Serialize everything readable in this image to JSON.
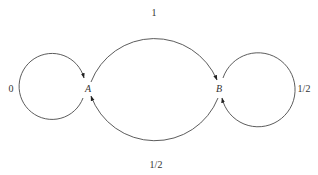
{
  "diagram": {
    "type": "state-transition-graph",
    "nodes": [
      {
        "id": "A",
        "label": "A"
      },
      {
        "id": "B",
        "label": "B"
      }
    ],
    "edges": [
      {
        "from": "A",
        "to": "A",
        "label": "0",
        "kind": "self-loop"
      },
      {
        "from": "A",
        "to": "B",
        "label": "1",
        "kind": "arc-top"
      },
      {
        "from": "B",
        "to": "B",
        "label": "1/2",
        "kind": "self-loop"
      },
      {
        "from": "B",
        "to": "A",
        "label": "1/2",
        "kind": "arc-bottom"
      }
    ],
    "colors": {
      "stroke": "#4a4a4a",
      "text": "#333333",
      "background": "#ffffff"
    }
  }
}
